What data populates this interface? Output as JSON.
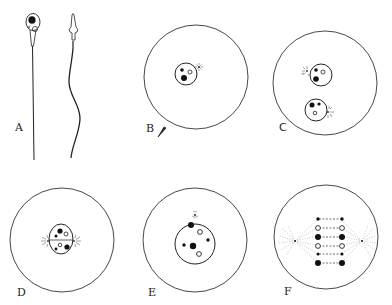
{
  "figure": {
    "panels": [
      {
        "id": "A",
        "label": "A",
        "content": "Two spermatozoa: one face view with dark nucleus and clear centrosome body, one side view with pointed acrosome and wavy tail"
      },
      {
        "id": "B",
        "label": "B",
        "content": "Egg with sperm entering at lower-left; nucleus with two dark bodies and one clear body; centrosome aster above-right"
      },
      {
        "id": "C",
        "label": "C",
        "content": "Egg with two pronuclei, each with an adjacent aster"
      },
      {
        "id": "D",
        "label": "D",
        "content": "Fused pronuclei in center with asters at left and right poles"
      },
      {
        "id": "E",
        "label": "E",
        "content": "Single nucleus with six chromatin bodies (dark and light), small aster above"
      },
      {
        "id": "F",
        "label": "F",
        "content": "Spindle with six pairs of chromosomes aligned between two poles, dashed spindle fibers"
      }
    ]
  },
  "colors": {
    "ink": "#222222",
    "background": "#ffffff"
  }
}
